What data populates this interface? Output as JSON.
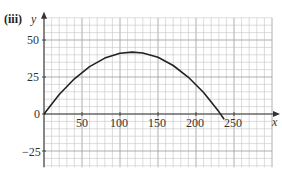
{
  "part_label": "(iii)",
  "chart_data": {
    "type": "line",
    "title": "",
    "xlabel": "x",
    "ylabel": "y",
    "xlim": [
      0,
      300
    ],
    "ylim": [
      -35,
      60
    ],
    "x_ticks": [
      50,
      100,
      150,
      200,
      250
    ],
    "y_ticks": [
      50,
      25,
      0,
      -25
    ],
    "grid": true,
    "minor_grid_x_step": 10,
    "minor_grid_y_step": 5,
    "series": [
      {
        "name": "curve",
        "color": "#222222",
        "x": [
          0,
          20,
          40,
          60,
          80,
          100,
          116,
          130,
          150,
          170,
          190,
          210,
          230,
          237
        ],
        "y": [
          0,
          13.2,
          23.8,
          32.0,
          37.8,
          41.0,
          41.8,
          41.2,
          38.3,
          32.8,
          24.8,
          14.5,
          1.6,
          -3.5
        ]
      }
    ]
  },
  "labels": {
    "y_axis": "y",
    "x_axis": "x",
    "origin": "0",
    "y50": "50",
    "y25": "25",
    "yneg25": "−25",
    "x50": "50",
    "x100": "100",
    "x150": "150",
    "x200": "200",
    "x250": "250"
  }
}
